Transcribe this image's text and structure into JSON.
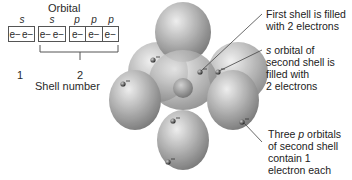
{
  "diagram": {
    "orbital_title": "Orbital",
    "orbital_labels": [
      "s",
      "s",
      "p",
      "p",
      "p"
    ],
    "boxes": [
      {
        "shell": 1,
        "orbital": "s",
        "electrons": [
          "e−",
          "e−"
        ]
      },
      {
        "shell": 2,
        "orbital": "s",
        "electrons": [
          "e−",
          "e−"
        ]
      },
      {
        "shell": 2,
        "orbital": "p",
        "electrons": [
          "e−"
        ]
      },
      {
        "shell": 2,
        "orbital": "p",
        "electrons": [
          "e−"
        ]
      },
      {
        "shell": 2,
        "orbital": "p",
        "electrons": [
          "e−"
        ]
      }
    ],
    "shell_numbers": [
      "1",
      "2"
    ],
    "shell_axis_label": "Shell number",
    "annotations": [
      {
        "line1": "First shell is filled",
        "line2": "with 2 electrons"
      },
      {
        "italic": "s",
        "line1": " orbital of",
        "line2": "second shell is",
        "line3": "filled with",
        "line4": "2 electrons"
      },
      {
        "line1_pre": "Three ",
        "italic": "p",
        "line1_post": " orbitals",
        "line2": "of second shell",
        "line3": "contain 1",
        "line4": "electron each"
      }
    ],
    "electron_label": "−",
    "colors": {
      "orbital_fill": "#9a9a9a",
      "orbital_highlight": "#e6e6e6",
      "electron": "#3a3a3a",
      "line": "#444444"
    }
  }
}
